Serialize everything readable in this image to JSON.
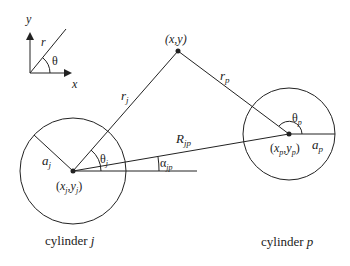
{
  "figure": {
    "type": "geometry-diagram"
  },
  "axes_inset": {
    "x_label": "x",
    "y_label": "y",
    "r_label": "r",
    "theta_label": "θ"
  },
  "field_point": {
    "label": "(x,y)"
  },
  "cylinder_j": {
    "caption_prefix": "cylinder ",
    "caption_var": "j",
    "center_label_x": "x",
    "center_label_xsub": "j",
    "center_label_y": "y",
    "center_label_ysub": "j",
    "radius_label": "a",
    "radius_sub": "j",
    "distance_label": "r",
    "distance_sub": "j",
    "angle_label": "θ",
    "angle_sub": "j"
  },
  "cylinder_p": {
    "caption_prefix": "cylinder ",
    "caption_var": "p",
    "center_label_x": "x",
    "center_label_xsub": "p",
    "center_label_y": "y",
    "center_label_ysub": "p",
    "radius_label": "a",
    "radius_sub": "p",
    "distance_label": "r",
    "distance_sub": "p",
    "angle_label": "θ",
    "angle_sub": "p"
  },
  "separation": {
    "distance_label": "R",
    "distance_sub": "jp",
    "angle_label": "α",
    "angle_sub": "jp"
  },
  "colors": {
    "line": "#222222",
    "background": "#ffffff"
  }
}
